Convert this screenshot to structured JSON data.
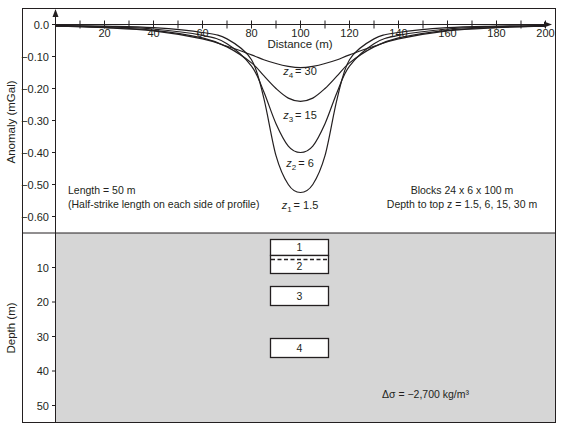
{
  "figure": {
    "top_panel": {
      "ylabel": "Anomaly (mGal)",
      "xlabel": "Distance (m)",
      "yticks": [
        "0.0",
        "−0.10",
        "−0.20",
        "−0.30",
        "−0.40",
        "−0.50",
        "−0.60"
      ],
      "xticks": [
        "20",
        "40",
        "60",
        "80",
        "100",
        "120",
        "140",
        "160",
        "180",
        "200"
      ],
      "note_left_line1": "Length = 50 m",
      "note_left_line2": "(Half-strike length on each side of profile)",
      "note_right_line1": "Blocks 24 x 6 x 100 m",
      "note_right_line2": "Depth to top z = 1.5, 6, 15, 30 m",
      "curve_labels": [
        {
          "var": "z",
          "sub": "4",
          "value": "= 30"
        },
        {
          "var": "z",
          "sub": "3",
          "value": "= 15"
        },
        {
          "var": "z",
          "sub": "2",
          "value": "= 6"
        },
        {
          "var": "z",
          "sub": "1",
          "value": "= 1.5"
        }
      ]
    },
    "bottom_panel": {
      "ylabel": "Depth (m)",
      "yticks": [
        "10",
        "20",
        "30",
        "40",
        "50"
      ],
      "blocks": [
        "1",
        "2",
        "3",
        "4"
      ],
      "density_label": "Δσ = −2,700 kg/m³"
    }
  },
  "chart_data": {
    "type": "line",
    "title": "",
    "xlabel": "Distance (m)",
    "ylabel": "Anomaly (mGal)",
    "xlim": [
      0,
      200
    ],
    "ylim": [
      -0.65,
      0.0
    ],
    "grid": false,
    "x": [
      0,
      20,
      40,
      60,
      70,
      80,
      85,
      90,
      95,
      100,
      105,
      110,
      115,
      120,
      130,
      140,
      160,
      180,
      200
    ],
    "series": [
      {
        "name": "z1 = 1.5 m",
        "values": [
          -0.003,
          -0.005,
          -0.01,
          -0.025,
          -0.045,
          -0.11,
          -0.23,
          -0.41,
          -0.5,
          -0.525,
          -0.5,
          -0.41,
          -0.23,
          -0.11,
          -0.045,
          -0.025,
          -0.01,
          -0.005,
          -0.003
        ]
      },
      {
        "name": "z2 = 6 m",
        "values": [
          -0.004,
          -0.007,
          -0.014,
          -0.034,
          -0.06,
          -0.13,
          -0.21,
          -0.31,
          -0.38,
          -0.4,
          -0.38,
          -0.31,
          -0.21,
          -0.13,
          -0.06,
          -0.034,
          -0.014,
          -0.007,
          -0.004
        ]
      },
      {
        "name": "z3 = 15 m",
        "values": [
          -0.005,
          -0.009,
          -0.018,
          -0.042,
          -0.07,
          -0.12,
          -0.16,
          -0.2,
          -0.23,
          -0.24,
          -0.23,
          -0.2,
          -0.16,
          -0.12,
          -0.07,
          -0.042,
          -0.018,
          -0.009,
          -0.005
        ]
      },
      {
        "name": "z4 = 30 m",
        "values": [
          -0.005,
          -0.01,
          -0.02,
          -0.045,
          -0.068,
          -0.095,
          -0.11,
          -0.122,
          -0.131,
          -0.135,
          -0.131,
          -0.122,
          -0.11,
          -0.095,
          -0.068,
          -0.045,
          -0.02,
          -0.01,
          -0.005
        ]
      }
    ],
    "annotations": [
      "Length = 50 m (Half-strike length on each side of profile)",
      "Blocks 24 x 6 x 100 m",
      "Depth to top z = 1.5, 6, 15, 30 m",
      "Δσ = −2,700 kg/m³"
    ],
    "cross_section": {
      "ylabel": "Depth (m)",
      "ylim": [
        0,
        55
      ],
      "blocks": [
        {
          "label": "1",
          "x": [
            88,
            112
          ],
          "depth_top": 1.5,
          "depth_bottom": 7.5
        },
        {
          "label": "2",
          "x": [
            88,
            112
          ],
          "depth_top": 6,
          "depth_bottom": 12
        },
        {
          "label": "3",
          "x": [
            88,
            112
          ],
          "depth_top": 15,
          "depth_bottom": 21
        },
        {
          "label": "4",
          "x": [
            88,
            112
          ],
          "depth_top": 30,
          "depth_bottom": 36
        }
      ],
      "density_contrast": "−2,700 kg/m³"
    }
  }
}
